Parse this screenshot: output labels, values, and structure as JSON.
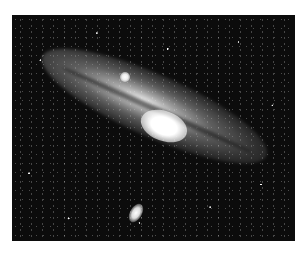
{
  "image": {
    "subject": "Andromeda galaxy (spiral galaxy) with two satellite galaxies against a star field",
    "style": "black and white astronomical photograph",
    "colors": {
      "background": "#0c0c0c",
      "galaxy_core": "#ffffff",
      "margin": "#ffffff"
    }
  }
}
